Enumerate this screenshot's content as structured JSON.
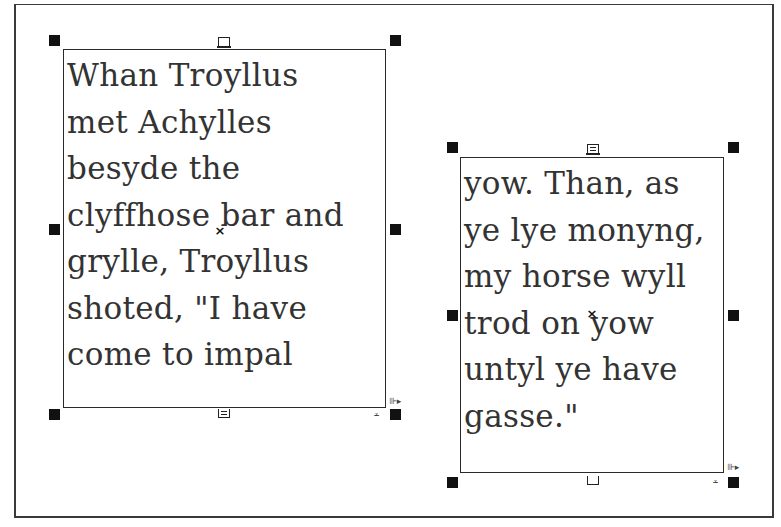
{
  "canvas": {
    "background": "#ffffff",
    "border_color": "#3a3a3a"
  },
  "frames": [
    {
      "id": "frame-1",
      "selected": true,
      "lines": [
        "Whan Troyllus",
        "met Achylles",
        "besyde the",
        "clyffhose bar and",
        "grylle, Troyllus",
        "shoted, \"I have",
        "come to impal"
      ],
      "in_port": "empty",
      "out_port": "threaded",
      "center_mark": "×",
      "corner_glyphs": {
        "right": "⊪▸",
        "bottom": "⩡"
      }
    },
    {
      "id": "frame-2",
      "selected": true,
      "lines": [
        "yow. Than, as",
        "ye lye monyng,",
        "my horse wyll",
        "trod on yow",
        "untyl ye have",
        "gasse.\""
      ],
      "in_port": "threaded",
      "out_port": "empty",
      "center_mark": "×",
      "corner_glyphs": {
        "right": "⊪▸",
        "bottom": "⩡"
      }
    }
  ]
}
